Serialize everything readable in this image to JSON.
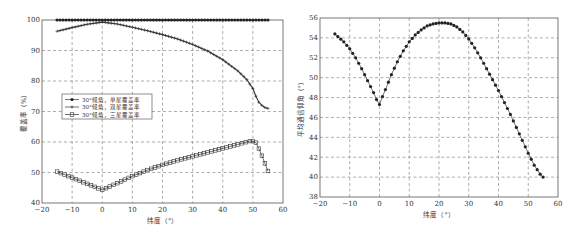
{
  "chart_data": [
    {
      "type": "line",
      "title": "",
      "xlabel": "纬度（°）",
      "ylabel": "覆盖率（%）",
      "xlim": [
        -20,
        60
      ],
      "ylim": [
        40,
        100
      ],
      "xticks": [
        -20,
        -10,
        0,
        10,
        20,
        30,
        40,
        50,
        60
      ],
      "yticks": [
        40,
        50,
        60,
        70,
        80,
        90,
        100
      ],
      "grid": true,
      "legend_position": "center-left",
      "series": [
        {
          "name": "30°倾角，单星覆盖率",
          "marker": "dot",
          "x": [
            -15,
            -10,
            -5,
            0,
            5,
            10,
            15,
            20,
            25,
            30,
            35,
            40,
            45,
            50,
            55
          ],
          "values": [
            100,
            100,
            100,
            100,
            100,
            100,
            100,
            100,
            100,
            100,
            100,
            100,
            100,
            100,
            100
          ]
        },
        {
          "name": "30°倾角，双星覆盖率",
          "marker": "plus",
          "x": [
            -15,
            -10,
            -5,
            0,
            5,
            10,
            15,
            20,
            25,
            30,
            35,
            40,
            45,
            48,
            50,
            51,
            52,
            53,
            54,
            55
          ],
          "values": [
            96.3,
            97.5,
            98.6,
            99.3,
            98.7,
            97.6,
            96.5,
            95.2,
            93.8,
            92.0,
            89.8,
            87.0,
            83.3,
            80.5,
            77.5,
            75.0,
            73.0,
            72.0,
            71.3,
            71.0
          ]
        },
        {
          "name": "30°倾角，三星覆盖率",
          "marker": "square",
          "x": [
            -15,
            -10,
            -5,
            0,
            5,
            10,
            15,
            20,
            25,
            30,
            35,
            40,
            45,
            49,
            50,
            51,
            52,
            53,
            54,
            55
          ],
          "values": [
            50.3,
            48.3,
            46.3,
            44.3,
            46.5,
            48.8,
            50.8,
            52.5,
            54.0,
            55.3,
            56.6,
            57.9,
            59.2,
            60.3,
            60.3,
            59.8,
            57.8,
            55.5,
            53.0,
            50.5
          ]
        }
      ]
    },
    {
      "type": "line",
      "title": "",
      "xlabel": "纬度（°）",
      "ylabel": "平均通信仰角（°）",
      "xlim": [
        -20,
        60
      ],
      "ylim": [
        38,
        56
      ],
      "xticks": [
        -20,
        -10,
        0,
        10,
        20,
        30,
        40,
        50,
        60
      ],
      "yticks": [
        38,
        40,
        42,
        44,
        46,
        48,
        50,
        52,
        54,
        56
      ],
      "grid": true,
      "legend_position": "none",
      "series": [
        {
          "name": "平均通信仰角",
          "marker": "dot",
          "x": [
            -15,
            -12,
            -10,
            -8,
            -6,
            -4,
            -2,
            -1,
            0,
            1,
            2,
            4,
            6,
            8,
            10,
            12,
            14,
            16,
            18,
            20,
            22,
            24,
            26,
            28,
            30,
            32,
            34,
            36,
            38,
            40,
            42,
            44,
            46,
            48,
            50,
            52,
            54,
            55
          ],
          "values": [
            54.4,
            53.6,
            52.9,
            52.0,
            50.9,
            49.7,
            48.5,
            47.8,
            47.3,
            48.1,
            48.8,
            50.3,
            51.6,
            52.7,
            53.6,
            54.3,
            54.8,
            55.2,
            55.4,
            55.5,
            55.5,
            55.4,
            55.1,
            54.6,
            53.9,
            53.0,
            52.0,
            50.9,
            49.8,
            48.7,
            47.5,
            46.3,
            45.0,
            43.7,
            42.4,
            41.2,
            40.3,
            40.0
          ]
        }
      ]
    }
  ]
}
